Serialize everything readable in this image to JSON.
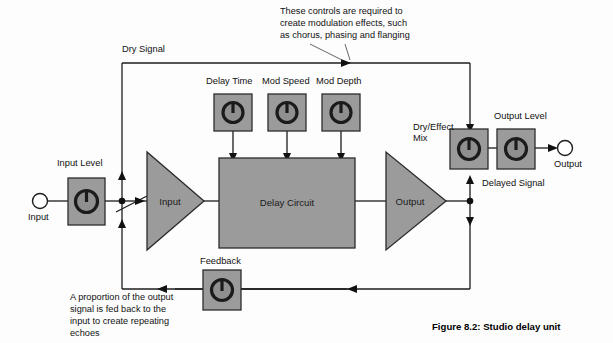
{
  "figure": {
    "caption": "Figure 8.2: Studio delay unit"
  },
  "annotations": {
    "modulation_note": {
      "lines": [
        "These controls are required to",
        "create modulation effects, such",
        "as chorus, phasing and flanging"
      ]
    },
    "feedback_note": {
      "lines": [
        "A proportion of the output",
        "signal is fed back to the",
        "input to create repeating",
        "echoes"
      ]
    }
  },
  "signal_paths": {
    "dry_signal": "Dry Signal",
    "delayed_signal": "Delayed Signal"
  },
  "jacks": {
    "input": "Input",
    "output": "Output"
  },
  "amplifiers": [
    {
      "id": "input-amp",
      "label": "Input"
    },
    {
      "id": "output-amp",
      "label": "Output"
    }
  ],
  "blocks": [
    {
      "id": "delay-circuit",
      "label": "Delay Circuit"
    }
  ],
  "knobs": [
    {
      "id": "input-level",
      "label": "Input Level"
    },
    {
      "id": "delay-time",
      "label": "Delay Time"
    },
    {
      "id": "mod-speed",
      "label": "Mod Speed"
    },
    {
      "id": "mod-depth",
      "label": "Mod Depth"
    },
    {
      "id": "dry-effect-mix",
      "label_line1": "Dry/Effect",
      "label_line2": "Mix"
    },
    {
      "id": "output-level",
      "label": "Output Level"
    },
    {
      "id": "feedback",
      "label": "Feedback"
    }
  ],
  "colors": {
    "block_fill": "#9b9b9b",
    "outline": "#1d1d1d",
    "background": "#fdfdfd",
    "knob_fill": "#8f8f8f"
  }
}
